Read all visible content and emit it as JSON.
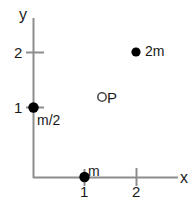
{
  "figure": {
    "type": "physics-coordinate-diagram",
    "axes": {
      "x_label": "x",
      "y_label": "y",
      "x_ticks": [
        {
          "value": "1",
          "px": 84
        },
        {
          "value": "2",
          "px": 136
        }
      ],
      "y_ticks": [
        {
          "value": "1",
          "px": 107
        },
        {
          "value": "2",
          "px": 52
        }
      ],
      "origin_px": {
        "x": 33,
        "y": 177
      },
      "unit_px": 52,
      "line_color": "#8c8c8c"
    },
    "points": [
      {
        "id": "mass-half-m",
        "label": "m/2",
        "marker": "filled-circle",
        "coords": {
          "x": 0,
          "y": 1
        },
        "px": {
          "x": 33,
          "y": 107
        },
        "color": "#000000"
      },
      {
        "id": "mass-m",
        "label": "m",
        "marker": "filled-circle",
        "coords": {
          "x": 1,
          "y": 0
        },
        "px": {
          "x": 84,
          "y": 177
        },
        "color": "#000000"
      },
      {
        "id": "mass-2m",
        "label": "2m",
        "marker": "filled-circle",
        "coords": {
          "x": 2,
          "y": 2.4
        },
        "px": {
          "x": 136,
          "y": 52
        },
        "color": "#000000"
      },
      {
        "id": "point-p",
        "label": "P",
        "marker": "open-circle",
        "coords": {
          "x": 1.33,
          "y": 1.54
        },
        "px": {
          "x": 102,
          "y": 97
        },
        "color": "#000000"
      }
    ]
  }
}
